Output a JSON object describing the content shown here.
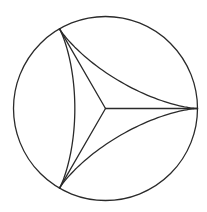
{
  "figure": {
    "shapes": {
      "circle": {
        "role": "bounding circle"
      },
      "deltoid": {
        "cusps": 3,
        "role": "curvilinear triangle with concave sides"
      },
      "spokes": {
        "count": 3,
        "role": "segments from centre to each cusp"
      }
    },
    "cusp_angles_deg": [
      180,
      300,
      60
    ],
    "colors": {
      "line": "#2a2a2a",
      "background": "#ffffff"
    }
  }
}
